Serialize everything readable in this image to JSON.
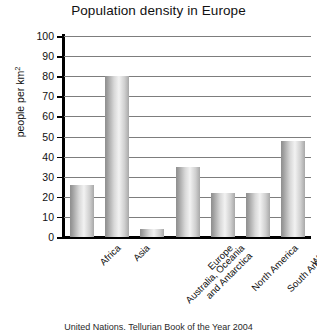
{
  "chart_data": {
    "type": "bar",
    "title": "Population density in Europe",
    "xlabel": "",
    "ylabel": "people per km²",
    "ylim": [
      0,
      100
    ],
    "yticks": [
      0,
      10,
      20,
      30,
      40,
      50,
      60,
      70,
      80,
      90,
      100
    ],
    "grid": true,
    "legend": "none",
    "categories": [
      "Africa",
      "Asia",
      "Australia, Oceania and Antarctica",
      "Europe",
      "North America",
      "South America",
      "World"
    ],
    "category_lines": [
      [
        "Africa"
      ],
      [
        "Asia"
      ],
      [
        "Australia, Oceania",
        "and Antarctica"
      ],
      [
        "Europe"
      ],
      [
        "North America"
      ],
      [
        "South America"
      ],
      [
        "World"
      ]
    ],
    "values": [
      26,
      80,
      4,
      35,
      22,
      22,
      48
    ],
    "bar_color": "#c8c8c8"
  },
  "caption": {
    "text": "United Nations, Tellurian Book of the Year 2004"
  }
}
